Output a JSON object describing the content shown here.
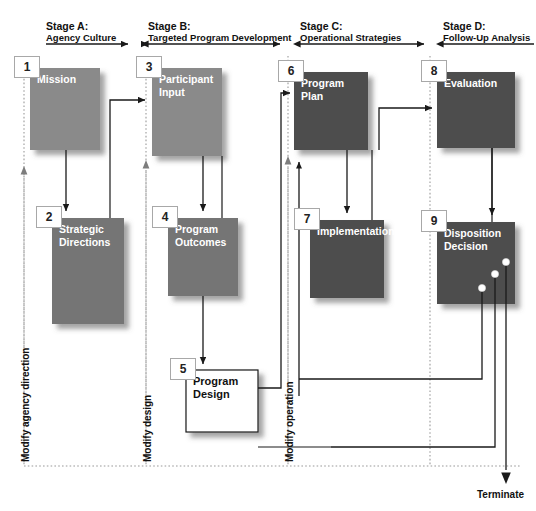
{
  "diagram": {
    "colors": {
      "box_gray_light": "#8a8a8a",
      "box_gray_mid": "#757575",
      "box_gray_dark": "#4d4d4d",
      "box_white": "#ffffff",
      "tag_border": "#a8a8a8",
      "line": "#1a1a1a",
      "dotted": "#9a9a9a",
      "text_light": "#ffffff",
      "text_dark": "#111111"
    },
    "stages": [
      {
        "id": "stage-a",
        "name": "Stage A:",
        "subtitle": "Agency Culture"
      },
      {
        "id": "stage-b",
        "name": "Stage B:",
        "subtitle": "Targeted Program Development"
      },
      {
        "id": "stage-c",
        "name": "Stage C:",
        "subtitle": "Operational Strategies"
      },
      {
        "id": "stage-d",
        "name": "Stage D:",
        "subtitle": "Follow-Up Analysis"
      }
    ],
    "nodes": [
      {
        "id": "node-1",
        "number": "1",
        "label": "Mission",
        "stage": "A",
        "fill": "light"
      },
      {
        "id": "node-2",
        "number": "2",
        "label": "Strategic Directions",
        "stage": "A",
        "fill": "mid"
      },
      {
        "id": "node-3",
        "number": "3",
        "label": "Participant Input",
        "stage": "B",
        "fill": "light"
      },
      {
        "id": "node-4",
        "number": "4",
        "label": "Program Outcomes",
        "stage": "B",
        "fill": "mid"
      },
      {
        "id": "node-5",
        "number": "5",
        "label": "Program Design",
        "stage": "B",
        "fill": "white"
      },
      {
        "id": "node-6",
        "number": "6",
        "label": "Program Plan",
        "stage": "C",
        "fill": "dark"
      },
      {
        "id": "node-7",
        "number": "7",
        "label": "Implementation",
        "stage": "C",
        "fill": "dark"
      },
      {
        "id": "node-8",
        "number": "8",
        "label": "Evaluation",
        "stage": "D",
        "fill": "dark"
      },
      {
        "id": "node-9",
        "number": "9",
        "label": "Disposition Decision",
        "stage": "D",
        "fill": "dark"
      }
    ],
    "feedback_labels": [
      {
        "id": "modify-agency-direction",
        "text": "Modify agency direction"
      },
      {
        "id": "modify-design",
        "text": "Modify design"
      },
      {
        "id": "modify-operation",
        "text": "Modify operation"
      }
    ],
    "terminal": {
      "id": "terminate",
      "label": "Terminate"
    },
    "decision_outputs": 3
  }
}
